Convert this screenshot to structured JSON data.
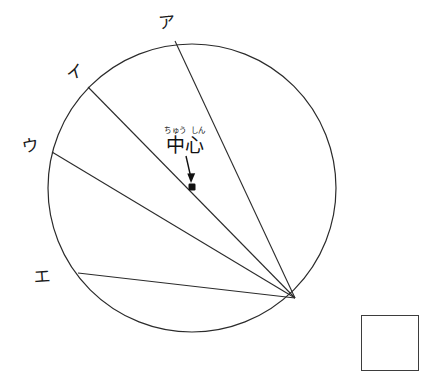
{
  "figure": {
    "type": "geometry-diagram",
    "background_color": "#ffffff",
    "stroke_color": "#2b2b2b",
    "circle": {
      "cx": 192,
      "cy": 188,
      "r": 144,
      "stroke_width": 1.2
    },
    "vertex": {
      "label": "convergence-point",
      "x": 295,
      "y": 298
    },
    "center_point": {
      "x": 192,
      "y": 187,
      "size": 7,
      "color": "#111111"
    },
    "chords": [
      {
        "name": "chord-a",
        "label": "ア",
        "x1": 175,
        "y1": 41,
        "x2": 295,
        "y2": 298
      },
      {
        "name": "chord-i",
        "label": "イ",
        "x1": 88,
        "y1": 87,
        "x2": 295,
        "y2": 298
      },
      {
        "name": "chord-u",
        "label": "ウ",
        "x1": 52,
        "y1": 152,
        "x2": 295,
        "y2": 298
      },
      {
        "name": "chord-e",
        "label": "エ",
        "x1": 78,
        "y1": 273,
        "x2": 295,
        "y2": 298
      }
    ],
    "arrow": {
      "x1": 186,
      "y1": 157,
      "x2": 192,
      "y2": 181
    }
  },
  "labels": {
    "a": "ア",
    "i": "イ",
    "u": "ウ",
    "e": "エ"
  },
  "center_annotation": {
    "furigana_1": "ちゅう",
    "furigana_2": "しん",
    "text": "中心"
  },
  "answer_box": {
    "value": "",
    "placeholder": "",
    "border_color": "#3d3d3d"
  }
}
